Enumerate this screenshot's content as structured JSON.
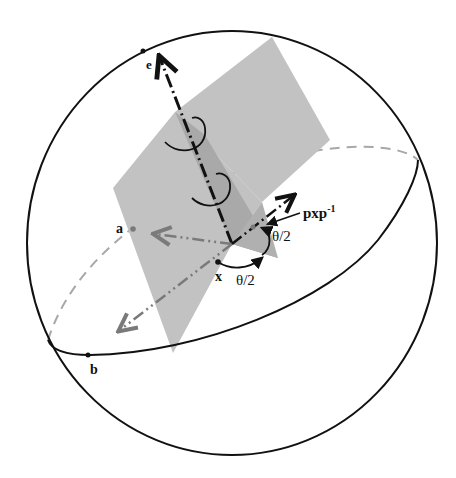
{
  "diagram": {
    "labels": {
      "e": "e",
      "a": "a",
      "b": "b",
      "x": "x",
      "theta_half_1": "θ/2",
      "theta_half_2": "θ/2",
      "pxp_base": "pxp",
      "pxp_sup": "-1"
    },
    "colors": {
      "outline": "#111111",
      "plane_light": "#c2c2c2",
      "plane_dark": "#a9a9a9",
      "dashed_gray": "#a0a0a0",
      "axis_gray": "#7a7a7a"
    }
  }
}
